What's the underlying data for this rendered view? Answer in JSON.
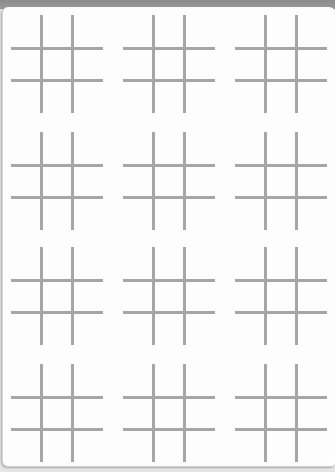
{
  "sheet": {
    "type": "tic-tac-toe grid sheet",
    "rows": 4,
    "columns": 3,
    "board_count": 12,
    "line_color": "#a6a6a6",
    "background_color": "#fdfdfd",
    "boards": [
      {
        "row": 1,
        "col": 1,
        "cells": [
          "",
          "",
          "",
          "",
          "",
          "",
          "",
          "",
          ""
        ]
      },
      {
        "row": 1,
        "col": 2,
        "cells": [
          "",
          "",
          "",
          "",
          "",
          "",
          "",
          "",
          ""
        ]
      },
      {
        "row": 1,
        "col": 3,
        "cells": [
          "",
          "",
          "",
          "",
          "",
          "",
          "",
          "",
          ""
        ]
      },
      {
        "row": 2,
        "col": 1,
        "cells": [
          "",
          "",
          "",
          "",
          "",
          "",
          "",
          "",
          ""
        ]
      },
      {
        "row": 2,
        "col": 2,
        "cells": [
          "",
          "",
          "",
          "",
          "",
          "",
          "",
          "",
          ""
        ]
      },
      {
        "row": 2,
        "col": 3,
        "cells": [
          "",
          "",
          "",
          "",
          "",
          "",
          "",
          "",
          ""
        ]
      },
      {
        "row": 3,
        "col": 1,
        "cells": [
          "",
          "",
          "",
          "",
          "",
          "",
          "",
          "",
          ""
        ]
      },
      {
        "row": 3,
        "col": 2,
        "cells": [
          "",
          "",
          "",
          "",
          "",
          "",
          "",
          "",
          ""
        ]
      },
      {
        "row": 3,
        "col": 3,
        "cells": [
          "",
          "",
          "",
          "",
          "",
          "",
          "",
          "",
          ""
        ]
      },
      {
        "row": 4,
        "col": 1,
        "cells": [
          "",
          "",
          "",
          "",
          "",
          "",
          "",
          "",
          ""
        ]
      },
      {
        "row": 4,
        "col": 2,
        "cells": [
          "",
          "",
          "",
          "",
          "",
          "",
          "",
          "",
          ""
        ]
      },
      {
        "row": 4,
        "col": 3,
        "cells": [
          "",
          "",
          "",
          "",
          "",
          "",
          "",
          "",
          ""
        ]
      }
    ]
  }
}
